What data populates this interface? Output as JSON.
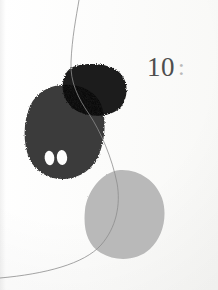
{
  "page": {
    "background_color": "#fcfcfb",
    "width": 218,
    "height": 290
  },
  "caption": {
    "figure_number": "10",
    "separator": ":",
    "number_color": "#4e4e4e",
    "separator_color": "#b9b9b9"
  },
  "artwork": {
    "title": "Abstract composition with blobs and hairline curve",
    "shapes": [
      {
        "name": "dark-charcoal-blob",
        "role": "large organic mass, lower-left of pair",
        "color": "#3b3b3b",
        "bounds": {
          "x": 24,
          "y": 84,
          "width": 80,
          "height": 95
        }
      },
      {
        "name": "near-black-rounded-blob",
        "role": "rounded-square mass, upper right of pair",
        "color": "#1b1b1b",
        "bounds": {
          "x": 63,
          "y": 64,
          "width": 64,
          "height": 52
        }
      },
      {
        "name": "overlap-region",
        "role": "multiply overlap of the two dark blobs",
        "color": "#090909"
      },
      {
        "name": "eye-hole-left",
        "role": "white oval void in charcoal blob",
        "color": "#fbfbfa",
        "bounds": {
          "x": 45,
          "y": 151,
          "width": 9,
          "height": 14
        }
      },
      {
        "name": "eye-hole-right",
        "role": "white oval void in charcoal blob",
        "color": "#fbfbfa",
        "bounds": {
          "x": 57,
          "y": 150,
          "width": 10,
          "height": 15
        }
      },
      {
        "name": "light-gray-blob",
        "role": "pale oval mass, lower right",
        "color": "#b9b9b9",
        "bounds": {
          "x": 85,
          "y": 169,
          "width": 79,
          "height": 90
        }
      },
      {
        "name": "hairline-curve",
        "role": "thin pen line sweeping top to lower-left",
        "color": "#8d8d8d",
        "stroke_width": 0.8,
        "enters_at": "top edge x=79",
        "exits_at": "left edge y=277"
      }
    ]
  }
}
